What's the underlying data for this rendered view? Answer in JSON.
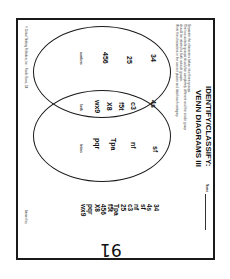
{
  "worksheet": {
    "title_line1": "IDENTIFY/CLASSIFY:",
    "title_line2": "VENN DIAGRAMS III",
    "name_label": "Name",
    "instructions": [
      "Separate the characters below into three groups.",
      "The two outside groups should be completely different and the inside group",
      "should be related to both outside groups.",
      "Write the characters in the correct places and label each category."
    ],
    "word_list": [
      "34",
      "4s",
      "sf",
      "nf",
      "c3",
      "25",
      "Tpa",
      "f5t",
      "456",
      "X8",
      "pqr",
      "wx9"
    ],
    "venn": {
      "left_circle_label": "numbers",
      "right_circle_label": "letters",
      "intersection_label": "both",
      "left_items": [
        "34",
        "25",
        "456"
      ],
      "intersection_items": [
        "4s",
        "c3",
        "f5t",
        "X8",
        "wx9"
      ],
      "right_items": [
        "nf",
        "Tpa",
        "pqr"
      ],
      "outside_items": [
        "sf"
      ]
    },
    "footer_left": "© Critical Thinking Publishers, Inc. · Pacific Grove, CA",
    "footer_right": "Answer Key",
    "page_number": "91"
  }
}
